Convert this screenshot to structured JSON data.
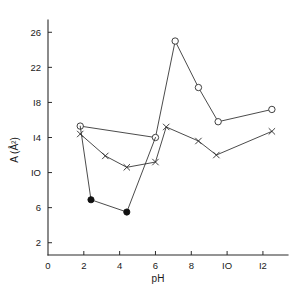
{
  "chart_data": {
    "type": "line",
    "title": "",
    "subtitle": "",
    "xlabel": "pH",
    "ylabel": "A (Å²)",
    "xlim": [
      0,
      13.4
    ],
    "ylim": [
      0.6,
      27.4
    ],
    "xticks": [
      0,
      2,
      4,
      6,
      8,
      10,
      12
    ],
    "xtick_labels": [
      "0",
      "2",
      "4",
      "6",
      "8",
      "IO",
      "I2"
    ],
    "yticks": [
      2,
      6,
      10,
      14,
      18,
      22,
      26
    ],
    "ytick_labels": [
      "2",
      "6",
      "IO",
      "I4",
      "I8",
      "22",
      "26"
    ],
    "grid": false,
    "legend": "none",
    "series": [
      {
        "name": "open-circle-series",
        "marker": "open-circle",
        "points": [
          {
            "x": 1.8,
            "y": 15.3
          },
          {
            "x": 6.0,
            "y": 14.0
          },
          {
            "x": 7.1,
            "y": 25.0
          },
          {
            "x": 8.4,
            "y": 19.7
          },
          {
            "x": 9.5,
            "y": 15.8
          },
          {
            "x": 12.5,
            "y": 17.2
          }
        ]
      },
      {
        "name": "filled-circle-series",
        "marker": "filled-circle",
        "points": [
          {
            "x": 1.8,
            "y": 15.3
          },
          {
            "x": 2.4,
            "y": 6.9
          },
          {
            "x": 4.4,
            "y": 5.5
          },
          {
            "x": 6.0,
            "y": 14.0
          }
        ],
        "filled_indices": [
          1,
          2
        ]
      },
      {
        "name": "cross-series",
        "marker": "cross",
        "points": [
          {
            "x": 1.8,
            "y": 14.4
          },
          {
            "x": 3.2,
            "y": 11.9
          },
          {
            "x": 4.4,
            "y": 10.6
          },
          {
            "x": 6.0,
            "y": 11.2
          },
          {
            "x": 6.6,
            "y": 15.2
          },
          {
            "x": 8.4,
            "y": 13.6
          },
          {
            "x": 9.4,
            "y": 12.0
          },
          {
            "x": 12.5,
            "y": 14.7
          }
        ]
      }
    ]
  },
  "figure": {
    "background_color": "#ffffff",
    "ink_color": "#2b2b2b"
  }
}
